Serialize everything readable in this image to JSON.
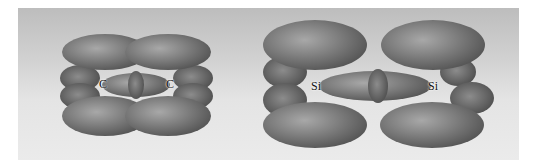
{
  "figure": {
    "background_color": "#d6d6d6",
    "lobe_color": "#7a7a7a",
    "molecules": [
      {
        "name": "carbon-dimer",
        "atoms": [
          {
            "label": "C",
            "x": 103,
            "y": 84
          },
          {
            "label": "C",
            "x": 170,
            "y": 84
          }
        ]
      },
      {
        "name": "silicon-dimer",
        "atoms": [
          {
            "label": "Si",
            "x": 316,
            "y": 86
          },
          {
            "label": "Si",
            "x": 433,
            "y": 86
          }
        ]
      }
    ]
  }
}
